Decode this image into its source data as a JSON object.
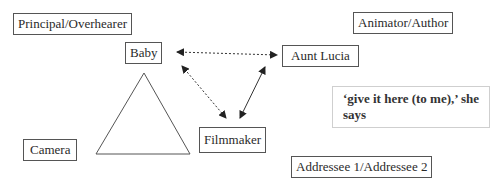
{
  "diagram": {
    "labels": {
      "principal": "Principal/Overhearer",
      "animator": "Animator/Author",
      "baby": "Baby",
      "aunt": "Aunt Lucia",
      "filmmaker": "Filmmaker",
      "camera": "Camera",
      "addressee": "Addressee 1/Addressee 2"
    },
    "quote": "‘give it here (to me),’ she says",
    "edges": [
      {
        "from": "Baby",
        "to": "Aunt Lucia",
        "style": "dotted",
        "direction": "both"
      },
      {
        "from": "Baby",
        "to": "Filmmaker",
        "style": "dotted",
        "direction": "both"
      },
      {
        "from": "Aunt Lucia",
        "to": "Filmmaker",
        "style": "solid",
        "direction": "both"
      }
    ],
    "shapes": [
      {
        "type": "triangle",
        "meaning": "camera-view"
      }
    ]
  }
}
